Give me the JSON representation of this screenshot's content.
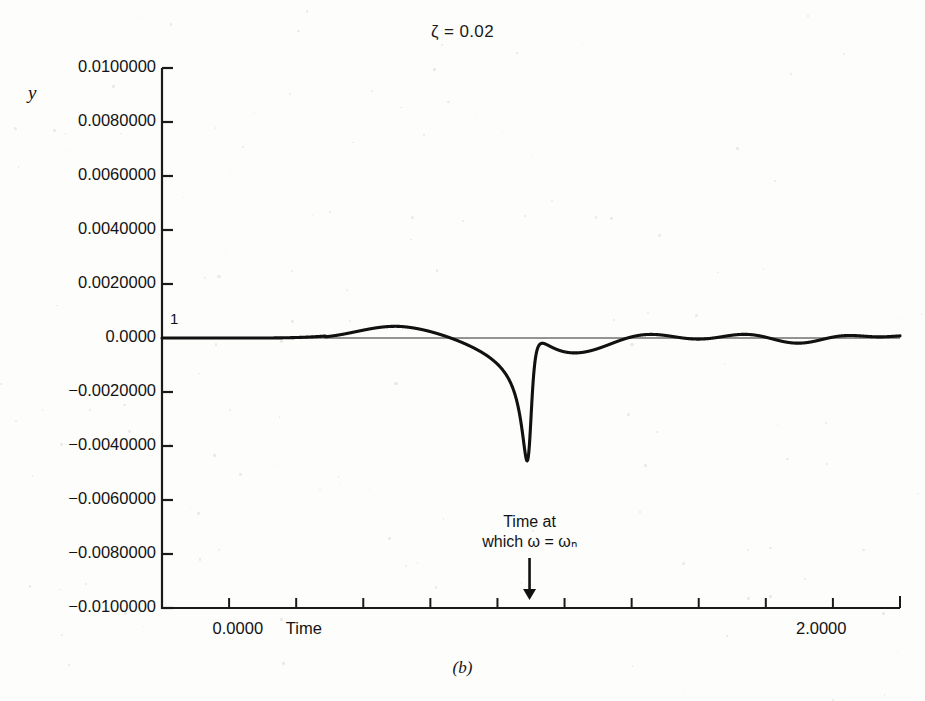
{
  "figure": {
    "caption": "(b)",
    "title": "ζ  =  0.02",
    "background_color": "#fdfdfc",
    "curve_color": "#111111",
    "axis_color": "#1a1a1a"
  },
  "axes": {
    "y_axis_label": "y",
    "x_axis_label": "Time",
    "inner_trace_label": "1",
    "y_ticks": [
      "0.0100000",
      "0.0080000",
      "0.0060000",
      "0.0040000",
      "0.0020000",
      "0.0000",
      "−0.0020000",
      "−0.0040000",
      "−0.0060000",
      "−0.0080000",
      "−0.0100000"
    ],
    "y_tick_values": [
      0.01,
      0.008,
      0.006,
      0.004,
      0.002,
      0.0,
      -0.002,
      -0.004,
      -0.006,
      -0.008,
      -0.01
    ],
    "x_tick_labels": [
      "0.0000",
      "2.0000"
    ],
    "x_tick_label_values": [
      0.0,
      2.0
    ],
    "x_tick_count": 11
  },
  "annotation": {
    "line1": "Time at",
    "line2": "which ω = ωₙ",
    "arrow": "↓",
    "x_value": 1.0
  },
  "chart_data": {
    "type": "line",
    "title": "ζ = 0.02",
    "xlabel": "Time",
    "ylabel": "y",
    "xlim": [
      -0.26,
      2.27
    ],
    "ylim": [
      -0.01,
      0.01
    ],
    "grid": false,
    "legend": null,
    "series": [
      {
        "name": "swept-sine response, damping ratio 0.02",
        "description": "Linear frequency sweep (chirp) through the natural frequency of a lightly damped single-degree-of-freedom system. Amplitude builds to a maximum of about 0.0045 near the resonance crossing, then decays with beating.",
        "model": {
          "kind": "swept_sine_resonance",
          "zeta": 0.02,
          "sweep_start_freq_hz": 0.0,
          "sweep_rate": 11.0,
          "resonance_time": 1.0,
          "peak_amplitude": 0.00455,
          "peak_time": 0.905,
          "min_amplitude": -0.0046,
          "min_time": 0.96
        },
        "sampled_points": [
          {
            "t": -0.26,
            "y": 0.0
          },
          {
            "t": -0.1,
            "y": 0.0
          },
          {
            "t": 0.0,
            "y": 0.0
          },
          {
            "t": 0.12,
            "y": -5e-05
          },
          {
            "t": 0.2,
            "y": -0.00035
          },
          {
            "t": 0.28,
            "y": -0.00055
          },
          {
            "t": 0.35,
            "y": -0.00025
          },
          {
            "t": 0.42,
            "y": 0.00055
          },
          {
            "t": 0.48,
            "y": 0.0007
          },
          {
            "t": 0.55,
            "y": -0.0003
          },
          {
            "t": 0.6,
            "y": -0.00115
          },
          {
            "t": 0.66,
            "y": 0.00135
          },
          {
            "t": 0.72,
            "y": 0.002
          },
          {
            "t": 0.76,
            "y": -0.0023
          },
          {
            "t": 0.8,
            "y": -0.0029
          },
          {
            "t": 0.84,
            "y": 0.0028
          },
          {
            "t": 0.87,
            "y": 0.003
          },
          {
            "t": 0.9,
            "y": -0.004
          },
          {
            "t": 0.93,
            "y": 0.00455
          },
          {
            "t": 0.96,
            "y": -0.0046
          },
          {
            "t": 1.0,
            "y": 0.0029
          },
          {
            "t": 1.05,
            "y": -0.0015
          },
          {
            "t": 1.1,
            "y": 0.00245
          },
          {
            "t": 1.16,
            "y": -0.00375
          },
          {
            "t": 1.22,
            "y": 0.0023
          },
          {
            "t": 1.28,
            "y": -0.0012
          },
          {
            "t": 1.34,
            "y": 0.0029
          },
          {
            "t": 1.4,
            "y": -0.0026
          },
          {
            "t": 1.46,
            "y": 0.0024
          },
          {
            "t": 1.52,
            "y": -0.0023
          },
          {
            "t": 1.58,
            "y": 0.00205
          },
          {
            "t": 1.64,
            "y": -0.0021
          },
          {
            "t": 1.7,
            "y": 0.00185
          },
          {
            "t": 1.76,
            "y": -0.00195
          },
          {
            "t": 1.84,
            "y": 0.0018
          },
          {
            "t": 1.92,
            "y": -0.00185
          },
          {
            "t": 2.0,
            "y": 0.0018
          },
          {
            "t": 2.1,
            "y": -0.00175
          },
          {
            "t": 2.18,
            "y": 0.0017
          },
          {
            "t": 2.27,
            "y": -0.0012
          }
        ]
      }
    ]
  }
}
